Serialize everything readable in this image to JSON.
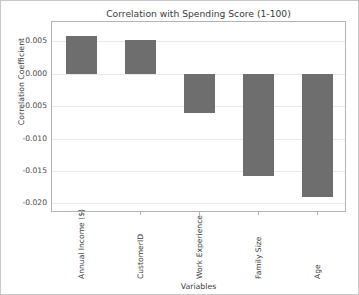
{
  "chart_data": {
    "type": "bar",
    "title": "Correlation with Spending Score (1-100)",
    "xlabel": "Variables",
    "ylabel": "Correlation Coefficient",
    "categories": [
      "Annual Income ($)",
      "CustomerID",
      "Work Experience",
      "Family Size",
      "Age"
    ],
    "values": [
      0.0058,
      0.0052,
      -0.0061,
      -0.0158,
      -0.019
    ],
    "ylim": [
      -0.0215,
      0.008
    ],
    "yticks": [
      0.005,
      0.0,
      -0.005,
      -0.01,
      -0.015,
      -0.02
    ],
    "ytick_labels": [
      "0.005",
      "0.000",
      "-0.005",
      "-0.010",
      "-0.015",
      "-0.020"
    ],
    "grid": true,
    "legend": false,
    "bar_color": "#6e6e6e",
    "background_color": "#ffffff"
  }
}
